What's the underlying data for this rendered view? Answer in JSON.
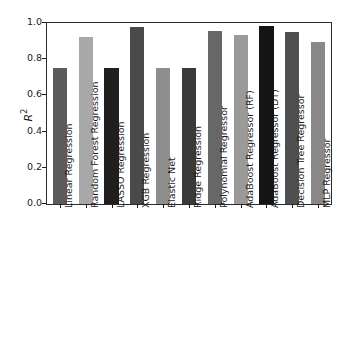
{
  "chart_data": {
    "type": "bar",
    "title": "",
    "xlabel": "",
    "ylabel": "R²",
    "ylabel_base": "R",
    "ylabel_sup": "2",
    "ylim": [
      0.0,
      1.0
    ],
    "grid": false,
    "legend": null,
    "yticks": [
      "0.0",
      "0.2",
      "0.4",
      "0.6",
      "0.8",
      "1.0"
    ],
    "ytick_values": [
      0.0,
      0.2,
      0.4,
      0.6,
      0.8,
      1.0
    ],
    "categories": [
      "Linear Regression",
      "Random Forest Regression",
      "LASSO Regression",
      "XGB Regression",
      "Elastic Net",
      "Ridge Regression",
      "Polynomial Regressor",
      "AdaBoost Regressor (RF)",
      "AdaBoost Regressor (DT)",
      "Decision Tree Regressor",
      "MLP Regressor"
    ],
    "values": [
      0.75,
      0.92,
      0.75,
      0.98,
      0.75,
      0.75,
      0.955,
      0.935,
      0.985,
      0.95,
      0.895
    ],
    "bar_colors": [
      "#5c5c5c",
      "#a8a8a8",
      "#1f1f1f",
      "#4a4a4a",
      "#8e8e8e",
      "#3a3a3a",
      "#676767",
      "#9a9a9a",
      "#141414",
      "#4f4f4f",
      "#888888"
    ]
  },
  "figure": {
    "axis_color": "#2b2b2b",
    "background": "#ffffff",
    "text_color": "#1a1a1a"
  }
}
